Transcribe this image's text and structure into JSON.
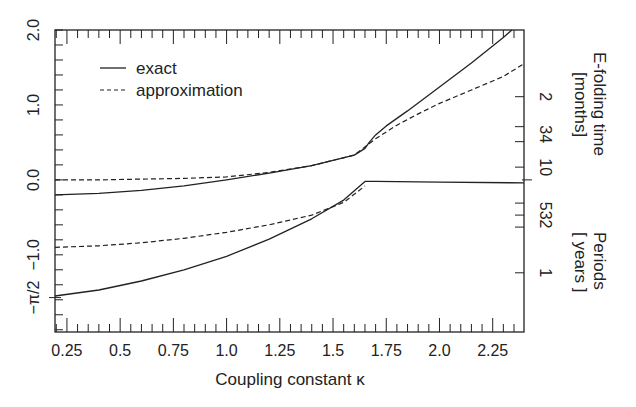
{
  "chart_data": {
    "type": "line",
    "title": "",
    "xlabel": "Coupling constant κ",
    "ylabel": "",
    "xlim": [
      0.194,
      2.397
    ],
    "ylim": [
      -2.03,
      2.0
    ],
    "grid": false,
    "legend_position": "upper left",
    "x_ticks": [
      {
        "value": 0.25,
        "label": "0.25"
      },
      {
        "value": 0.5,
        "label": "0.5"
      },
      {
        "value": 0.75,
        "label": "0.75"
      },
      {
        "value": 1.0,
        "label": "1.0"
      },
      {
        "value": 1.25,
        "label": "1.25"
      },
      {
        "value": 1.5,
        "label": "1.5"
      },
      {
        "value": 1.75,
        "label": "1.75"
      },
      {
        "value": 2.0,
        "label": "2.0"
      },
      {
        "value": 2.25,
        "label": "2.25"
      }
    ],
    "y_ticks_left": [
      {
        "value": 2.0,
        "label": "2.0"
      },
      {
        "value": 1.0,
        "label": "1.0"
      },
      {
        "value": 0.0,
        "label": "0.0"
      },
      {
        "value": -1.0,
        "label": "−1.0"
      },
      {
        "value": -1.5708,
        "label": "−π/2"
      }
    ],
    "right_axis": {
      "upper_title_line1": "E-folding time",
      "upper_title_line2": "[months]",
      "lower_title_line1": "Periods",
      "lower_title_line2": "[ years ]",
      "upper_ticks": [
        {
          "value": 1.11,
          "label": "2"
        },
        {
          "value": 0.71,
          "label": "3"
        },
        {
          "value": 0.51,
          "label": "4"
        },
        {
          "value": 0.17,
          "label": "10"
        }
      ],
      "lower_ticks": [
        {
          "value": -0.31,
          "label": "5"
        },
        {
          "value": -0.47,
          "label": "3"
        },
        {
          "value": -0.63,
          "label": "2"
        },
        {
          "value": -1.24,
          "label": "1"
        }
      ]
    },
    "legend": [
      {
        "label": "exact",
        "style": "solid"
      },
      {
        "label": "approximation",
        "style": "dashed"
      }
    ],
    "series": [
      {
        "name": "exact (growth rate)",
        "style": "solid",
        "x": [
          0.194,
          0.4,
          0.6,
          0.8,
          1.0,
          1.2,
          1.4,
          1.6,
          1.65,
          1.67,
          1.7,
          1.75,
          1.85,
          2.0,
          2.15,
          2.3,
          2.34
        ],
        "y": [
          -0.2,
          -0.18,
          -0.14,
          -0.08,
          0.0,
          0.09,
          0.19,
          0.33,
          0.42,
          0.5,
          0.6,
          0.72,
          0.92,
          1.24,
          1.56,
          1.9,
          2.0
        ]
      },
      {
        "name": "approximation (growth rate)",
        "style": "dashed",
        "x": [
          0.194,
          0.4,
          0.6,
          0.8,
          1.0,
          1.2,
          1.4,
          1.6,
          1.7,
          1.8,
          1.9,
          2.0,
          2.15,
          2.3,
          2.397
        ],
        "y": [
          0.0,
          0.0,
          0.01,
          0.02,
          0.04,
          0.1,
          0.19,
          0.33,
          0.55,
          0.73,
          0.88,
          1.02,
          1.2,
          1.38,
          1.55
        ]
      },
      {
        "name": "exact (frequency)",
        "style": "solid",
        "x": [
          0.194,
          0.4,
          0.6,
          0.8,
          1.0,
          1.2,
          1.4,
          1.55,
          1.65,
          1.7,
          2.0,
          2.397
        ],
        "y": [
          -1.55,
          -1.47,
          -1.35,
          -1.2,
          -1.02,
          -0.79,
          -0.52,
          -0.27,
          -0.02,
          -0.02,
          -0.03,
          -0.04
        ]
      },
      {
        "name": "approximation (frequency)",
        "style": "dashed",
        "x": [
          0.194,
          0.4,
          0.6,
          0.8,
          1.0,
          1.2,
          1.4,
          1.55,
          1.65
        ],
        "y": [
          -0.9,
          -0.88,
          -0.84,
          -0.78,
          -0.7,
          -0.6,
          -0.47,
          -0.3,
          -0.08
        ]
      }
    ]
  }
}
